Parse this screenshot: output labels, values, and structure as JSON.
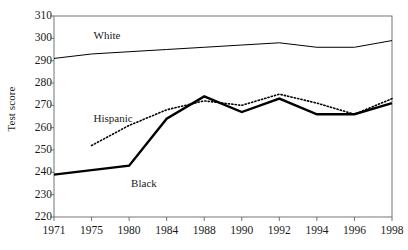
{
  "chart_data": {
    "type": "line",
    "title": "",
    "xlabel": "",
    "ylabel": "Test score",
    "x": [
      1971,
      1975,
      1980,
      1984,
      1988,
      1990,
      1992,
      1994,
      1996,
      1998
    ],
    "xtick_labels": [
      "1971",
      "1975",
      "1980",
      "1984",
      "1988",
      "1990",
      "1992",
      "1994",
      "1996",
      "1998"
    ],
    "ylim": [
      220,
      310
    ],
    "yticks": [
      220,
      230,
      240,
      250,
      260,
      270,
      280,
      290,
      300,
      310
    ],
    "ytick_labels": [
      "220",
      "230",
      "240",
      "250",
      "260",
      "270",
      "280",
      "290",
      "300",
      "310"
    ],
    "grid": false,
    "legend_position": "inline-annotations",
    "series": [
      {
        "name": "White",
        "style": "solid-thin",
        "color": "#000000",
        "x": [
          1971,
          1975,
          1980,
          1984,
          1988,
          1990,
          1992,
          1994,
          1996,
          1998
        ],
        "values": [
          291,
          293,
          294,
          295,
          296,
          297,
          298,
          296,
          296,
          299
        ]
      },
      {
        "name": "Black",
        "style": "solid-thick",
        "color": "#000000",
        "x": [
          1971,
          1975,
          1980,
          1984,
          1988,
          1990,
          1992,
          1994,
          1996,
          1998
        ],
        "values": [
          239,
          241,
          243,
          264,
          274,
          267,
          273,
          266,
          266,
          271
        ]
      },
      {
        "name": "Hispanic",
        "style": "dotted",
        "color": "#000000",
        "x": [
          1975,
          1980,
          1984,
          1988,
          1990,
          1992,
          1994,
          1996,
          1998
        ],
        "values": [
          252,
          261,
          268,
          272,
          270,
          275,
          271,
          266,
          273
        ]
      }
    ],
    "annotations": [
      {
        "text": "White",
        "x": 1975,
        "y": 301
      },
      {
        "text": "Hispanic",
        "x": 1975,
        "y": 264
      },
      {
        "text": "Black",
        "x": 1977,
        "y": 235
      }
    ]
  }
}
